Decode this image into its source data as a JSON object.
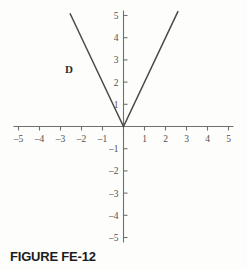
{
  "figure": {
    "caption": "FIGURE FE-12"
  },
  "chart_data": {
    "type": "line",
    "title": "",
    "xlabel": "",
    "ylabel": "",
    "xlim": [
      -5,
      5
    ],
    "ylim": [
      -5,
      5
    ],
    "grid": false,
    "legend": "none",
    "x_ticks": [
      -5,
      -4,
      -3,
      -2,
      -1,
      1,
      2,
      3,
      4,
      5
    ],
    "x_tick_labels": [
      "–5",
      "–4",
      "–3",
      "–2",
      "–1",
      "1",
      "2",
      "3",
      "4",
      "5"
    ],
    "y_ticks": [
      5,
      4,
      3,
      2,
      1,
      -1,
      -2,
      -3,
      -4,
      -5
    ],
    "y_tick_labels": [
      "5",
      "4",
      "3",
      "2",
      "1",
      "–1",
      "–2",
      "–3",
      "–4",
      "–5"
    ],
    "series": [
      {
        "name": "D",
        "equation": "y = 2|x|",
        "label": "D",
        "label_x": -2.6,
        "label_y": 2.6,
        "points": [
          {
            "x": -2.55,
            "y": 5.1
          },
          {
            "x": 0,
            "y": 0
          },
          {
            "x": 2.6,
            "y": 5.2
          }
        ]
      }
    ],
    "axis_color": "#6f6f6f",
    "curve_color": "#4a4a48"
  }
}
